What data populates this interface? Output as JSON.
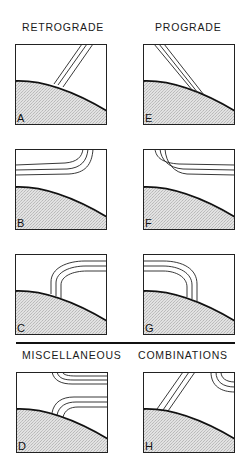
{
  "headings": {
    "retrograde": "RETROGRADE",
    "prograde": "PROGRADE",
    "miscellaneous": "MISCELLANEOUS",
    "combinations": "COMBINATIONS"
  },
  "panels": [
    {
      "label": "A",
      "group": "retrograde",
      "description": "three parallel straight lines rising up-right from surface"
    },
    {
      "label": "B",
      "group": "retrograde",
      "description": "three lines curving from top edge to left edge (concave down-left)"
    },
    {
      "label": "C",
      "group": "retrograde",
      "description": "three arcs rising from surface curving right to right edge"
    },
    {
      "label": "D",
      "group": "miscellaneous",
      "description": "two sets of curved lines: top set from top to right, bottom set from surface to right"
    },
    {
      "label": "E",
      "group": "prograde",
      "description": "three parallel straight lines descending from top-left to surface"
    },
    {
      "label": "F",
      "group": "prograde",
      "description": "three lines curving from top edge to right edge"
    },
    {
      "label": "G",
      "group": "prograde",
      "description": "three arcs from left edge curving down to surface"
    },
    {
      "label": "H",
      "group": "combinations",
      "description": "straight parallel lines from surface up-right plus small concentric arcs at top-right corner"
    }
  ],
  "colors": {
    "stroke": "#1a1a1a",
    "surface_fill": "#d6d6d6",
    "background": "#ffffff"
  }
}
